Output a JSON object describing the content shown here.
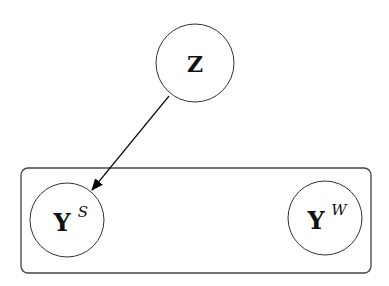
{
  "diagram": {
    "type": "graphical-model",
    "nodes": [
      {
        "id": "Z",
        "label": "Z",
        "superscript": ""
      },
      {
        "id": "YS",
        "label": "Y",
        "superscript": "S"
      },
      {
        "id": "YW",
        "label": "Y",
        "superscript": "W"
      }
    ],
    "edges": [
      {
        "from": "Z",
        "to": "YS",
        "directed": true
      }
    ],
    "plate": {
      "contains": [
        "YS",
        "YW"
      ],
      "label": ""
    }
  }
}
